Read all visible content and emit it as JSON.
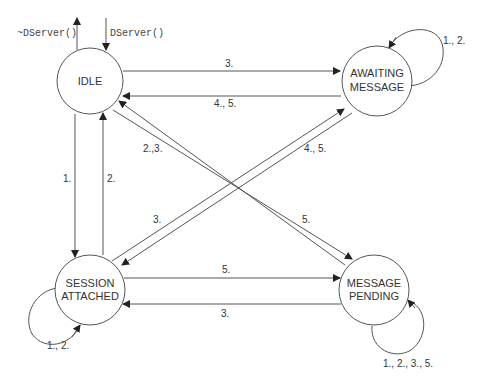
{
  "diagram": {
    "type": "state-machine",
    "external": {
      "destructor_label": "~DServer()",
      "constructor_label": "DServer()"
    },
    "states": [
      {
        "id": "idle",
        "lines": [
          "IDLE"
        ]
      },
      {
        "id": "awaiting",
        "lines": [
          "AWAITING",
          "MESSAGE"
        ]
      },
      {
        "id": "session",
        "lines": [
          "SESSION",
          "ATTACHED"
        ]
      },
      {
        "id": "pending",
        "lines": [
          "MESSAGE",
          "PENDING"
        ]
      }
    ],
    "transitions": [
      {
        "from": "idle",
        "to": "awaiting",
        "label": "3."
      },
      {
        "from": "awaiting",
        "to": "idle",
        "label": "4., 5."
      },
      {
        "from": "idle",
        "to": "session",
        "label": "1."
      },
      {
        "from": "session",
        "to": "idle",
        "label": "2."
      },
      {
        "from": "pending",
        "to": "idle",
        "label": "2.,3."
      },
      {
        "from": "session",
        "to": "awaiting",
        "label": "4., 5."
      },
      {
        "from": "awaiting",
        "to": "session",
        "label": "3."
      },
      {
        "from": "idle",
        "to": "pending",
        "label": "5."
      },
      {
        "from": "session",
        "to": "pending",
        "label": "5."
      },
      {
        "from": "pending",
        "to": "session",
        "label": "3."
      },
      {
        "from": "awaiting",
        "to": "awaiting",
        "label": "1., 2."
      },
      {
        "from": "session",
        "to": "session",
        "label": "1., 2."
      },
      {
        "from": "pending",
        "to": "pending",
        "label": "1., 2., 3., 5."
      }
    ]
  }
}
